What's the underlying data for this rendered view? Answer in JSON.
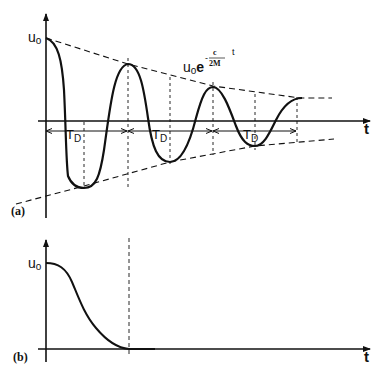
{
  "figure": {
    "panel_a": {
      "label": "(a)",
      "y_label": "u",
      "y_label_sub": "o",
      "x_label": "t",
      "envelope_label": {
        "base": "u",
        "base_sub": "o",
        "exp_base": "e",
        "exp_minus": "-",
        "exp_num": "c",
        "exp_den": "2M",
        "exp_var": "t"
      },
      "period_label": "T",
      "period_sub": "D",
      "curve": "damped oscillation",
      "envelope_style": "dashed"
    },
    "panel_b": {
      "label": "(b)",
      "y_label": "u",
      "y_label_sub": "o",
      "x_label": "t",
      "curve": "critically damped decay"
    },
    "colors": {
      "stroke": "#111111",
      "background": "#ffffff"
    }
  }
}
